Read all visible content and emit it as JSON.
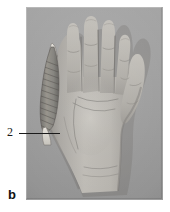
{
  "figure": {
    "panel_label": "b",
    "callouts": [
      {
        "number": "2",
        "target": "hypothenar-muscle"
      }
    ],
    "photo": {
      "subject": "left-hand-palm",
      "background_color": "#9d9d9d",
      "skin_color": "#b4b1ab",
      "shadow_color": "#6e6b67"
    },
    "overlay": {
      "structure": "abductor-digiti-minimi-muscle",
      "muscle_color": "#8d8a86",
      "tendon_color": "#dedbd4",
      "striation_color": "#4e4b48"
    },
    "leader_line": {
      "color": "#1a1a1a",
      "x_start": 19,
      "x_end": 60,
      "y": 133
    }
  }
}
